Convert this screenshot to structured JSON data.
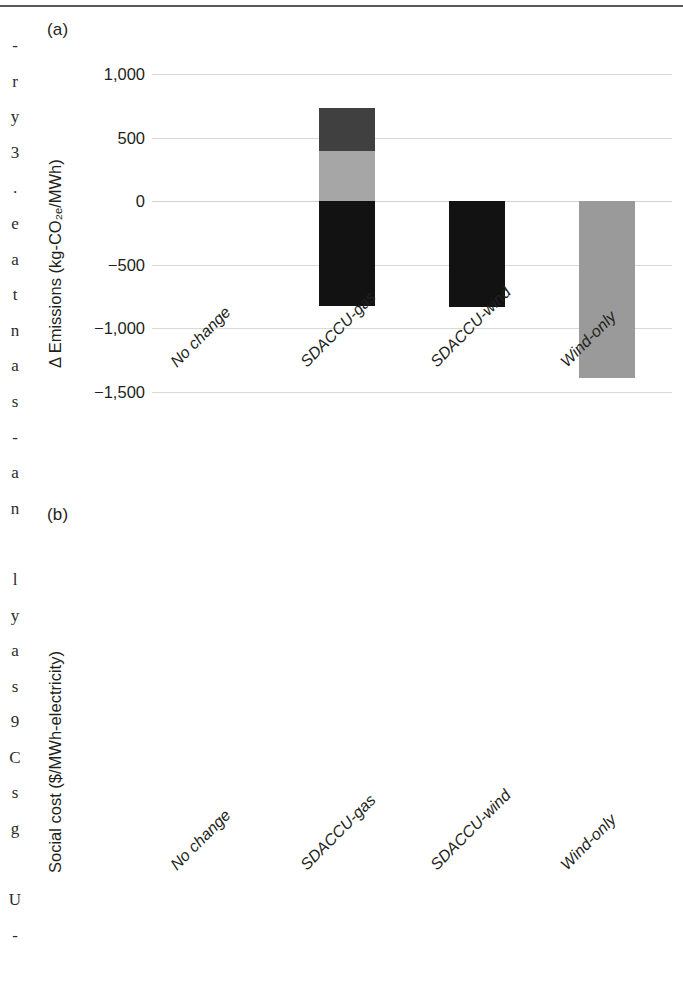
{
  "figure": {
    "gutter_text": "-\nr\ny\n3\n.\ne\na\nt\nn\na\ns\n-\na\nn\n\nl\ny\na\ns\n9\nC\ns\ng\n\nU\n-"
  },
  "chart_data": [
    {
      "type": "bar",
      "panel_label": "(a)",
      "title": "",
      "xlabel": "",
      "ylabel": "Δ Emissions (kg-CO₂ₑ/MWh)",
      "categories": [
        "No change",
        "SDACCU-gas",
        "SDACCU-wind",
        "Wind-only"
      ],
      "ylim": [
        -1500,
        1000
      ],
      "yticks": [
        1000,
        500,
        0,
        -500,
        -1000,
        -1500
      ],
      "ytick_labels": [
        "1,000",
        "500",
        "0",
        "−500",
        "−1,000",
        "−1,500"
      ],
      "grid": true,
      "legend": "none",
      "stacked": true,
      "series": [
        {
          "name": "segment-1-dark-gray",
          "color": "#404040",
          "values": [
            0,
            335,
            0,
            0
          ]
        },
        {
          "name": "segment-2-light-gray",
          "color": "#a6a6a6",
          "values": [
            0,
            395,
            0,
            -1390
          ]
        },
        {
          "name": "segment-3-black",
          "color": "#121212",
          "values": [
            0,
            -825,
            -830,
            0
          ]
        }
      ],
      "bars": [
        {
          "category": "No change",
          "segments": []
        },
        {
          "category": "SDACCU-gas",
          "segments": [
            {
              "name": "light-gray-positive",
              "from": 0,
              "to": 395,
              "color": "#a6a6a6"
            },
            {
              "name": "dark-gray-positive",
              "from": 395,
              "to": 730,
              "color": "#404040"
            },
            {
              "name": "black-negative",
              "from": 0,
              "to": -825,
              "color": "#121212"
            }
          ]
        },
        {
          "category": "SDACCU-wind",
          "segments": [
            {
              "name": "black-negative",
              "from": 0,
              "to": -830,
              "color": "#121212"
            }
          ]
        },
        {
          "category": "Wind-only",
          "segments": [
            {
              "name": "gray-negative",
              "from": 0,
              "to": -1390,
              "color": "#9a9a9a"
            }
          ]
        }
      ]
    },
    {
      "type": "bar",
      "panel_label": "(b)",
      "title": "",
      "xlabel": "",
      "ylabel": "Social cost ($/MWh-electricity)",
      "categories": [
        "No change",
        "SDACCU-gas",
        "SDACCU-wind",
        "Wind-only"
      ],
      "ylim": [
        0,
        400
      ],
      "yticks": [
        400,
        350,
        300,
        250,
        200,
        150,
        100,
        50,
        0
      ],
      "ytick_labels": [
        "400",
        "350",
        "300",
        "250",
        "200",
        "150",
        "100",
        "50",
        "0"
      ],
      "grid": true,
      "legend": "none",
      "stacked": true,
      "series": [
        {
          "name": "light-gray",
          "color": "#b0b0b0",
          "values": [
            0,
            136,
            135,
            0
          ]
        },
        {
          "name": "medium-gray",
          "color": "#7d7d7d",
          "values": [
            79,
            118,
            80,
            41
          ]
        },
        {
          "name": "black",
          "color": "#0d0d0d",
          "values": [
            152,
            142,
            61,
            0
          ]
        }
      ],
      "bars": [
        {
          "category": "No change",
          "segments": [
            {
              "name": "medium-gray",
              "from": 0,
              "to": 79,
              "color": "#7d7d7d"
            },
            {
              "name": "black",
              "from": 79,
              "to": 231,
              "color": "#0d0d0d"
            }
          ]
        },
        {
          "category": "SDACCU-gas",
          "segments": [
            {
              "name": "light-gray",
              "from": 0,
              "to": 136,
              "color": "#b0b0b0"
            },
            {
              "name": "medium-gray",
              "from": 136,
              "to": 254,
              "color": "#7d7d7d"
            },
            {
              "name": "black",
              "from": 254,
              "to": 396,
              "color": "#0d0d0d"
            }
          ]
        },
        {
          "category": "SDACCU-wind",
          "segments": [
            {
              "name": "light-gray",
              "from": 0,
              "to": 135,
              "color": "#b0b0b0"
            },
            {
              "name": "medium-gray",
              "from": 135,
              "to": 215,
              "color": "#7d7d7d"
            },
            {
              "name": "black",
              "from": 215,
              "to": 276,
              "color": "#0d0d0d"
            }
          ]
        },
        {
          "category": "Wind-only",
          "segments": [
            {
              "name": "medium-gray",
              "from": 0,
              "to": 41,
              "color": "#9a9a9a"
            }
          ]
        }
      ]
    }
  ]
}
